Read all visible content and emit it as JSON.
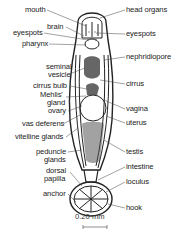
{
  "figure": {
    "labels_left": [
      {
        "id": "mouth",
        "text": "mouth",
        "x": 25,
        "y": 6
      },
      {
        "id": "brain",
        "text": "brain",
        "x": 47,
        "y": 23
      },
      {
        "id": "eyespots-left",
        "text": "eyespots",
        "x": 13,
        "y": 29
      },
      {
        "id": "pharynx",
        "text": "pharynx",
        "x": 22,
        "y": 40
      },
      {
        "id": "seminal-vesicle-1",
        "text": "seminal",
        "x": 46,
        "y": 63
      },
      {
        "id": "seminal-vesicle-2",
        "text": "vesicle",
        "x": 48,
        "y": 71
      },
      {
        "id": "cirrus-bulb",
        "text": "cirrus bulb",
        "x": 33,
        "y": 82
      },
      {
        "id": "mehlis-gland-1",
        "text": "Mehlis'",
        "x": 40,
        "y": 91
      },
      {
        "id": "mehlis-gland-2",
        "text": "gland",
        "x": 47,
        "y": 99
      },
      {
        "id": "ovary",
        "text": "ovary",
        "x": 48,
        "y": 107
      },
      {
        "id": "vas-deferens",
        "text": "vas deferens",
        "x": 22,
        "y": 120
      },
      {
        "id": "vitelline-glands",
        "text": "vitelline glands",
        "x": 15,
        "y": 133
      },
      {
        "id": "peduncle-glands-1",
        "text": "peduncle",
        "x": 36,
        "y": 148
      },
      {
        "id": "peduncle-glands-2",
        "text": "glands",
        "x": 44,
        "y": 156
      },
      {
        "id": "dorsal-papilla-1",
        "text": "dorsal",
        "x": 46,
        "y": 167
      },
      {
        "id": "dorsal-papilla-2",
        "text": "papilla",
        "x": 44,
        "y": 175
      },
      {
        "id": "anchor",
        "text": "anchor",
        "x": 43,
        "y": 190
      }
    ],
    "labels_right": [
      {
        "id": "head-organs",
        "text": "head organs",
        "x": 126,
        "y": 6
      },
      {
        "id": "eyespots-right",
        "text": "eyespots",
        "x": 126,
        "y": 30
      },
      {
        "id": "nephridiopore",
        "text": "nephridiopore",
        "x": 126,
        "y": 53
      },
      {
        "id": "cirrus",
        "text": "cirrus",
        "x": 126,
        "y": 80
      },
      {
        "id": "vagina",
        "text": "vagina",
        "x": 126,
        "y": 105
      },
      {
        "id": "uterus",
        "text": "uterus",
        "x": 126,
        "y": 119
      },
      {
        "id": "testis",
        "text": "testis",
        "x": 126,
        "y": 148
      },
      {
        "id": "intestine",
        "text": "intestine",
        "x": 126,
        "y": 163
      },
      {
        "id": "loculus",
        "text": "loculus",
        "x": 126,
        "y": 178
      },
      {
        "id": "hook",
        "text": "hook",
        "x": 126,
        "y": 204
      }
    ],
    "scale_bar": {
      "text": "0.20 mm",
      "length_px": 24
    }
  }
}
